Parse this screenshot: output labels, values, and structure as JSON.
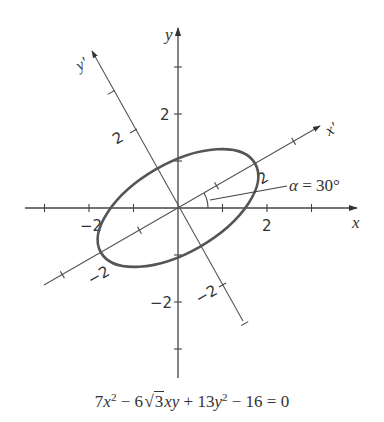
{
  "figure": {
    "type": "rotated-ellipse-diagram",
    "origin_px": [
      178,
      208
    ],
    "unit_px": 44.5,
    "rotation_deg": 30,
    "axes": {
      "x": {
        "label": "x",
        "range": [
          -3.4,
          4.0
        ],
        "ticks": [
          -3,
          -2,
          -1,
          1,
          2,
          3
        ],
        "tick_labels": [
          {
            "value": -2,
            "text": "−2"
          },
          {
            "value": 2,
            "text": "2"
          }
        ]
      },
      "y": {
        "label": "y",
        "range": [
          -3.8,
          4.0
        ],
        "ticks": [
          -3,
          -2,
          -1,
          1,
          2,
          3
        ],
        "tick_labels": [
          {
            "value": -2,
            "text": "−2"
          },
          {
            "value": 2,
            "text": "2"
          }
        ]
      },
      "x_prime": {
        "label": "x'",
        "range": [
          -2.8,
          3.8
        ],
        "ticks": [
          -3,
          -2,
          -1,
          1,
          2,
          3
        ],
        "tick_labels": [
          {
            "value": -2,
            "text": "−2"
          },
          {
            "value": 2,
            "text": "2"
          }
        ]
      },
      "y_prime": {
        "label": "y'",
        "range": [
          -3.5,
          3.6
        ],
        "ticks": [
          -3,
          -2,
          -1,
          1,
          2,
          3
        ],
        "tick_labels": [
          {
            "value": -2,
            "text": "−2"
          },
          {
            "value": 2,
            "text": "2"
          }
        ]
      }
    },
    "ellipse": {
      "semi_major": 2,
      "semi_minor": 1,
      "angle_deg": 30,
      "center": [
        0,
        0
      ]
    },
    "angle_annotation": {
      "text": "α = 30°",
      "symbol": "α",
      "value": "30°"
    }
  },
  "equation": {
    "text": "7x² − 6√3xy + 13y² − 16 = 0",
    "parts": {
      "c1": "7",
      "v1": "x",
      "e1": "2",
      "op1": " − 6",
      "rad": "3",
      "v2": "xy",
      "op2": " + 13",
      "v3": "y",
      "e3": "2",
      "op3": " − 16 = 0"
    }
  }
}
